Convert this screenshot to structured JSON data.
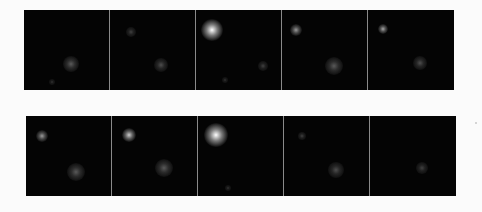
{
  "figure": {
    "background": "#fbfbfb",
    "panel_color": "#040404",
    "rows": [
      {
        "name": "top-row",
        "top": 10,
        "left": 24,
        "panels": [
          {
            "spots": [
              {
                "x": 47,
                "y": 54,
                "r": 8,
                "i": 0.35
              },
              {
                "x": 28,
                "y": 72,
                "r": 3,
                "i": 0.2
              }
            ]
          },
          {
            "spots": [
              {
                "x": 21,
                "y": 22,
                "r": 5,
                "i": 0.25
              },
              {
                "x": 51,
                "y": 55,
                "r": 7,
                "i": 0.3
              }
            ]
          },
          {
            "spots": [
              {
                "x": 16,
                "y": 20,
                "r": 11,
                "i": 1.0
              },
              {
                "x": 29,
                "y": 70,
                "r": 3,
                "i": 0.2
              },
              {
                "x": 67,
                "y": 56,
                "r": 5,
                "i": 0.25
              }
            ]
          },
          {
            "spots": [
              {
                "x": 14,
                "y": 20,
                "r": 6,
                "i": 0.6
              },
              {
                "x": 52,
                "y": 56,
                "r": 9,
                "i": 0.35
              }
            ]
          },
          {
            "spots": [
              {
                "x": 15,
                "y": 19,
                "r": 5,
                "i": 0.65
              },
              {
                "x": 52,
                "y": 53,
                "r": 7,
                "i": 0.3
              }
            ]
          }
        ]
      },
      {
        "name": "bottom-row",
        "top": 116,
        "left": 26,
        "panels": [
          {
            "spots": [
              {
                "x": 16,
                "y": 20,
                "r": 6,
                "i": 0.6
              },
              {
                "x": 50,
                "y": 56,
                "r": 9,
                "i": 0.35
              }
            ]
          },
          {
            "spots": [
              {
                "x": 17,
                "y": 19,
                "r": 7,
                "i": 0.8
              },
              {
                "x": 52,
                "y": 52,
                "r": 9,
                "i": 0.35
              }
            ]
          },
          {
            "spots": [
              {
                "x": 18,
                "y": 19,
                "r": 12,
                "i": 1.0
              },
              {
                "x": 30,
                "y": 72,
                "r": 3,
                "i": 0.2
              }
            ]
          },
          {
            "spots": [
              {
                "x": 18,
                "y": 20,
                "r": 4,
                "i": 0.25
              },
              {
                "x": 52,
                "y": 54,
                "r": 8,
                "i": 0.3
              }
            ]
          },
          {
            "spots": [
              {
                "x": 52,
                "y": 52,
                "r": 6,
                "i": 0.25
              }
            ]
          }
        ]
      }
    ],
    "artifact": {
      "x": 475,
      "y": 122
    }
  }
}
